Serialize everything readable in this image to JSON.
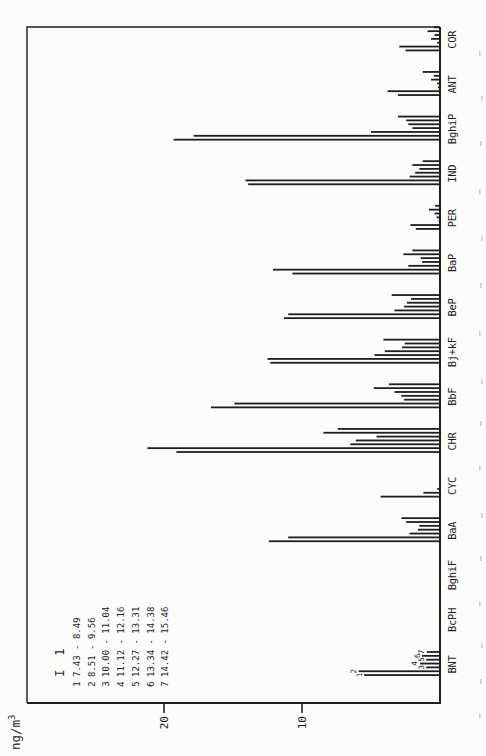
{
  "figure": {
    "orientation": "rotated-90-ccw-on-portrait-page",
    "ylabel_base": "ng/m",
    "ylabel_exponent": "3",
    "legend": {
      "title": "I 1",
      "entries": [
        {
          "num": "1",
          "range": " 7.43 -  8.49"
        },
        {
          "num": "2",
          "range": " 8.51 -  9.56"
        },
        {
          "num": "3",
          "range": "10.00 - 11.04"
        },
        {
          "num": "4",
          "range": "11.12 - 12.16"
        },
        {
          "num": "5",
          "range": "12.27 - 13.31"
        },
        {
          "num": "6",
          "range": "13.34 - 14.38"
        },
        {
          "num": "7",
          "range": "14.42 - 15.46"
        }
      ]
    },
    "colors": {
      "ink": "#1e1e1e",
      "paper": "#fcfcfa",
      "artifact": "#c3c0ba"
    }
  },
  "chart_data": {
    "type": "bar",
    "title": "",
    "xlabel": "",
    "ylabel": "ng/m³",
    "yticks": [
      10,
      20
    ],
    "ylim": [
      0,
      30
    ],
    "grid": false,
    "legend_title": "I 1",
    "legend_entries": [
      "1  7.43 -  8.49",
      "2  8.51 -  9.56",
      "3  10.00 - 11.04",
      "4  11.12 - 12.16",
      "5  12.27 - 13.31",
      "6  13.34 - 14.38",
      "7  14.42 - 15.46"
    ],
    "categories": [
      "BNT",
      "BcPH",
      "BghiF",
      "BaA",
      "CYC",
      "CHR",
      "BbF",
      "Bj+kF",
      "BeP",
      "BaP",
      "PER",
      "IND",
      "BghiP",
      "ANT",
      "COR"
    ],
    "series": [
      {
        "name": "1",
        "values": [
          5.5,
          0,
          0,
          12.4,
          4.3,
          19.1,
          16.6,
          12.3,
          11.3,
          10.7,
          1.75,
          13.9,
          19.3,
          3.05,
          2.5
        ]
      },
      {
        "name": "2",
        "values": [
          5.9,
          0,
          0,
          11.0,
          1.2,
          21.2,
          14.9,
          12.5,
          11.0,
          12.1,
          2.15,
          14.1,
          17.85,
          3.8,
          2.95
        ]
      },
      {
        "name": "3",
        "values": [
          1.0,
          0,
          0,
          2.2,
          0.2,
          6.5,
          2.6,
          4.75,
          3.3,
          2.3,
          0.1,
          2.2,
          5.0,
          0.15,
          0.2
        ]
      },
      {
        "name": "4",
        "values": [
          1.45,
          0,
          0,
          1.6,
          0,
          6.1,
          2.8,
          4.0,
          2.6,
          1.3,
          0.25,
          1.8,
          2.0,
          0.2,
          0.65
        ]
      },
      {
        "name": "5",
        "values": [
          1.0,
          0,
          0,
          1.5,
          0,
          4.6,
          3.3,
          2.75,
          2.4,
          1.4,
          0.4,
          1.5,
          2.3,
          0.65,
          0.4
        ]
      },
      {
        "name": "6",
        "values": [
          1.3,
          0,
          0,
          2.45,
          0,
          8.45,
          4.8,
          2.55,
          2.1,
          2.65,
          0.8,
          2.0,
          2.45,
          0.45,
          0.9
        ]
      },
      {
        "name": "7",
        "values": [
          0.95,
          0,
          0,
          2.8,
          0,
          7.4,
          3.7,
          4.1,
          3.5,
          2.0,
          0.35,
          1.25,
          3.05,
          1.25,
          0.45
        ]
      }
    ],
    "bar_number_labels_on_category": "BNT"
  }
}
